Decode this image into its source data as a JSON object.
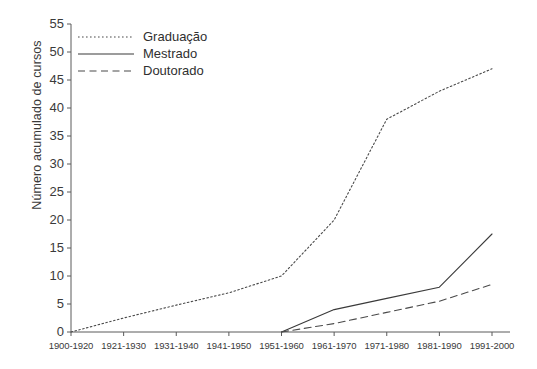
{
  "chart_data": {
    "type": "line",
    "title": "",
    "xlabel": "",
    "ylabel": "Número acumulado de cursos",
    "categories": [
      "1900-1920",
      "1921-1930",
      "1931-1940",
      "1941-1950",
      "1951-1960",
      "1961-1970",
      "1971-1980",
      "1981-1990",
      "1991-2000"
    ],
    "ylim": [
      0,
      55
    ],
    "ytick_labels": [
      "0",
      "5",
      "10",
      "15",
      "20",
      "25",
      "30",
      "35",
      "40",
      "45",
      "50",
      "55"
    ],
    "ytick_values": [
      0,
      5,
      10,
      15,
      20,
      25,
      30,
      35,
      40,
      45,
      50,
      55
    ],
    "grid": false,
    "legend_position": "top-left",
    "series": [
      {
        "name": "Graduação",
        "style": "dotted",
        "color": "#4a4a4a",
        "x": [
          "1900-1920",
          "1921-1930",
          "1931-1940",
          "1941-1950",
          "1951-1960",
          "1961-1970",
          "1971-1980",
          "1981-1990",
          "1991-2000"
        ],
        "values": [
          0,
          2.5,
          4.8,
          7,
          10,
          20,
          38,
          43,
          47
        ]
      },
      {
        "name": "Mestrado",
        "style": "solid",
        "color": "#3a3a3a",
        "x": [
          "1951-1960",
          "1961-1970",
          "1971-1980",
          "1981-1990",
          "1991-2000"
        ],
        "values": [
          0,
          4,
          6,
          8,
          17.5
        ]
      },
      {
        "name": "Doutorado",
        "style": "dashed",
        "color": "#4a4a4a",
        "x": [
          "1951-1960",
          "1961-1970",
          "1971-1980",
          "1981-1990",
          "1991-2000"
        ],
        "values": [
          0,
          1.5,
          3.5,
          5.5,
          8.5
        ]
      }
    ]
  },
  "legend": {
    "items": [
      {
        "label": "Graduação",
        "style": "dotted"
      },
      {
        "label": "Mestrado",
        "style": "solid"
      },
      {
        "label": "Doutorado",
        "style": "dashed"
      }
    ]
  },
  "axes": {
    "axis_color": "#5a5a5a"
  }
}
